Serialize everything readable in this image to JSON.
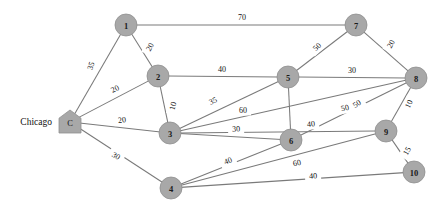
{
  "chart_data": {
    "type": "diagram",
    "title": "",
    "subtitle": "",
    "xlabel": "",
    "ylabel": "",
    "grid": false,
    "legend": "none",
    "graph_kind": "weighted-undirected-network",
    "depot_caption": "Chicago",
    "nodes": [
      {
        "id": "C",
        "label": "C",
        "shape": "house",
        "x": 70,
        "y": 122,
        "r": 11
      },
      {
        "id": "1",
        "label": "1",
        "shape": "circle",
        "x": 126,
        "y": 25,
        "r": 11
      },
      {
        "id": "2",
        "label": "2",
        "shape": "circle",
        "x": 158,
        "y": 76,
        "r": 11
      },
      {
        "id": "3",
        "label": "3",
        "shape": "circle",
        "x": 170,
        "y": 133,
        "r": 11
      },
      {
        "id": "4",
        "label": "4",
        "shape": "circle",
        "x": 171,
        "y": 188,
        "r": 11
      },
      {
        "id": "5",
        "label": "5",
        "shape": "circle",
        "x": 288,
        "y": 77,
        "r": 11
      },
      {
        "id": "6",
        "label": "6",
        "shape": "circle",
        "x": 291,
        "y": 140,
        "r": 11
      },
      {
        "id": "7",
        "label": "7",
        "shape": "circle",
        "x": 356,
        "y": 25,
        "r": 11
      },
      {
        "id": "8",
        "label": "8",
        "shape": "circle",
        "x": 416,
        "y": 78,
        "r": 11
      },
      {
        "id": "9",
        "label": "9",
        "shape": "circle",
        "x": 386,
        "y": 131,
        "r": 11
      },
      {
        "id": "10",
        "label": "10",
        "shape": "circle",
        "x": 414,
        "y": 172,
        "r": 11
      }
    ],
    "edges": [
      {
        "from": "C",
        "to": "1",
        "weight": "35",
        "lx": 91,
        "ly": 66,
        "rot": -70
      },
      {
        "from": "C",
        "to": "2",
        "weight": "20",
        "lx": 115,
        "ly": 89,
        "rot": -27
      },
      {
        "from": "C",
        "to": "3",
        "weight": "20",
        "lx": 122,
        "ly": 120,
        "rot": -6
      },
      {
        "from": "C",
        "to": "4",
        "weight": "30",
        "lx": 116,
        "ly": 156,
        "rot": 32
      },
      {
        "from": "1",
        "to": "2",
        "weight": "20",
        "lx": 150,
        "ly": 47,
        "rot": -62
      },
      {
        "from": "1",
        "to": "7",
        "weight": "70",
        "lx": 242,
        "ly": 17,
        "rot": 0
      },
      {
        "from": "2",
        "to": "3",
        "weight": "10",
        "lx": 173,
        "ly": 106,
        "rot": -78
      },
      {
        "from": "2",
        "to": "5",
        "weight": "40",
        "lx": 222,
        "ly": 69,
        "rot": 0
      },
      {
        "from": "3",
        "to": "5",
        "weight": "35",
        "lx": 213,
        "ly": 101,
        "rot": -25
      },
      {
        "from": "3",
        "to": "6",
        "weight": "30",
        "lx": 236,
        "ly": 129,
        "rot": -3
      },
      {
        "from": "3",
        "to": "8",
        "weight": "50",
        "lx": 345,
        "ly": 108,
        "rot": -12
      },
      {
        "from": "3",
        "to": "9",
        "weight": "40",
        "lx": 311,
        "ly": 124,
        "rot": -6
      },
      {
        "from": "4",
        "to": "6",
        "weight": "40",
        "lx": 228,
        "ly": 161,
        "rot": -22
      },
      {
        "from": "4",
        "to": "9",
        "weight": "60",
        "lx": 297,
        "ly": 163,
        "rot": -12
      },
      {
        "from": "4",
        "to": "10",
        "weight": "40",
        "lx": 313,
        "ly": 176,
        "rot": -3
      },
      {
        "from": "5",
        "to": "6",
        "weight": "60",
        "lx": 243,
        "ly": 110,
        "rot": 0
      },
      {
        "from": "5",
        "to": "7",
        "weight": "50",
        "lx": 317,
        "ly": 47,
        "rot": -42
      },
      {
        "from": "5",
        "to": "8",
        "weight": "30",
        "lx": 352,
        "ly": 70,
        "rot": 0
      },
      {
        "from": "6",
        "to": "8",
        "weight": "50",
        "lx": 357,
        "ly": 104,
        "rot": -33
      },
      {
        "from": "7",
        "to": "8",
        "weight": "20",
        "lx": 391,
        "ly": 44,
        "rot": -62
      },
      {
        "from": "8",
        "to": "9",
        "weight": "10",
        "lx": 409,
        "ly": 104,
        "rot": -65
      },
      {
        "from": "9",
        "to": "10",
        "weight": "15",
        "lx": 407,
        "ly": 151,
        "rot": -60
      }
    ],
    "colors": {
      "node_fill": "#a8a8a8",
      "edge_stroke": "#7a7a7a",
      "text": "#111111",
      "background": "#ffffff"
    }
  }
}
